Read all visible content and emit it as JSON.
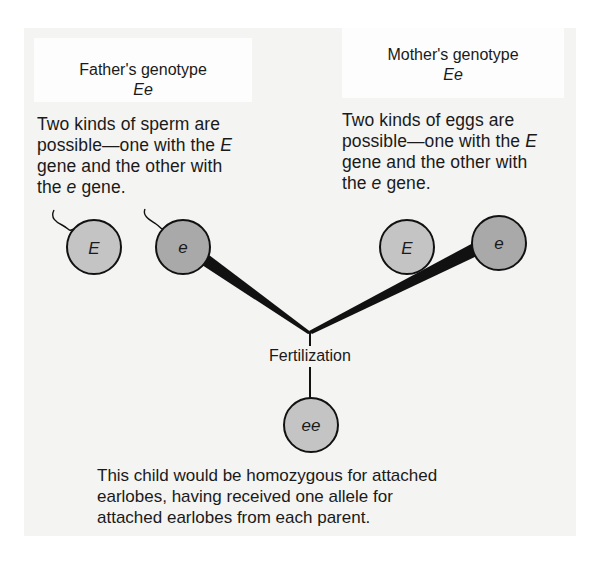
{
  "father": {
    "title": "Father's genotype",
    "genotype": "Ee",
    "description_lines": [
      "Two kinds of sperm are",
      "possible—one with the ",
      "gene and the other with",
      "the ",
      " gene."
    ],
    "description_italic": [
      "E",
      "e"
    ],
    "gametes": [
      {
        "allele": "E",
        "fill": "#c4c4c4",
        "selected": false
      },
      {
        "allele": "e",
        "fill": "#a9a9a9",
        "selected": true
      }
    ]
  },
  "mother": {
    "title": "Mother's genotype",
    "genotype": "Ee",
    "description_lines": [
      "Two kinds of eggs are",
      "possible—one with the ",
      "gene and the other with",
      "the ",
      " gene."
    ],
    "description_italic": [
      "E",
      "e"
    ],
    "gametes": [
      {
        "allele": "E",
        "fill": "#c4c4c4",
        "selected": false
      },
      {
        "allele": "e",
        "fill": "#a9a9a9",
        "selected": true
      }
    ]
  },
  "process_label": "Fertilization",
  "child": {
    "genotype": "ee",
    "fill": "#c4c4c4"
  },
  "caption_lines": [
    "This child would be homozygous for attached",
    "earlobes, having received one allele for",
    "attached earlobes from each parent."
  ],
  "colors": {
    "panel_bg": "#f4f4f3",
    "label_bg": "#fdfdfd",
    "line": "#111111",
    "light_gamete": "#c4c4c4",
    "dark_gamete": "#a9a9a9"
  }
}
